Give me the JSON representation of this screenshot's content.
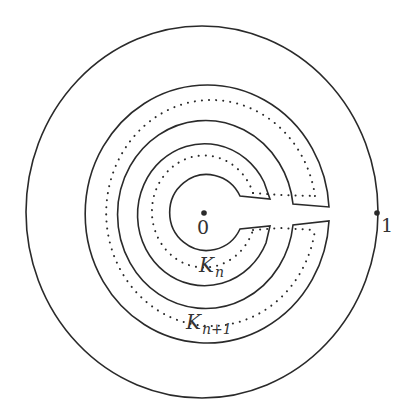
{
  "diagram": {
    "colors": {
      "stroke": "#2a2a2a",
      "text": "#333333",
      "background": "#ffffff"
    },
    "outer_circle": {
      "label": "1",
      "point": "marked-point-1"
    },
    "origin": {
      "label": "0"
    },
    "rings": [
      {
        "name": "K",
        "subscript": "n"
      },
      {
        "name": "K",
        "subscript": "n+1"
      }
    ]
  }
}
